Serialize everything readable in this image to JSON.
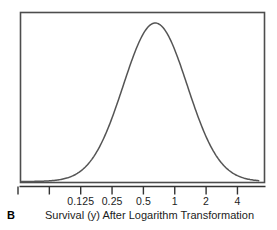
{
  "panel": {
    "letter": "B"
  },
  "axis": {
    "x_title": "Survival (y) After Logarithm Transformation"
  },
  "colors": {
    "curve": "#555555",
    "frame": "#4d4d4d",
    "axis": "#333333",
    "text": "#1c1c1c",
    "background": "#ffffff"
  },
  "chart_data": {
    "type": "line",
    "title": "",
    "subtitle": "",
    "xlabel": "Survival (y) After Logarithm Transformation",
    "ylabel": "",
    "x_scale": "log2",
    "grid": false,
    "legend": null,
    "annotations": [
      {
        "text": "B",
        "role": "panel-letter"
      }
    ],
    "tick_labels": [
      "",
      "",
      "0.125",
      "0.25",
      "0.5",
      "1",
      "2",
      "4"
    ],
    "ticks_visible_labels": [
      "0.125",
      "0.25",
      "0.5",
      "1",
      "2",
      "4"
    ],
    "tick_values": [
      0.03125,
      0.0625,
      0.125,
      0.25,
      0.5,
      1,
      2,
      4
    ],
    "xlim": [
      0.025,
      6.4
    ],
    "ylim": [
      0,
      1
    ],
    "distribution": {
      "shape": "normal-bell",
      "peak_x": 0.65,
      "peak_y": 1.0,
      "sigma_log2": 1.02
    },
    "series": [
      {
        "name": "Survival distribution (log scale)",
        "x": [
          0.0313,
          0.0394,
          0.0496,
          0.0625,
          0.0787,
          0.0992,
          0.125,
          0.1575,
          0.1984,
          0.25,
          0.315,
          0.3969,
          0.5,
          0.63,
          0.7937,
          1.0,
          1.2599,
          1.5874,
          2.0,
          2.5198,
          3.1748,
          4.0,
          5.0397,
          6.3496
        ],
        "y": [
          0.012,
          0.022,
          0.038,
          0.064,
          0.103,
          0.159,
          0.233,
          0.327,
          0.437,
          0.556,
          0.675,
          0.784,
          0.874,
          0.96,
          0.986,
          0.928,
          0.82,
          0.69,
          0.553,
          0.422,
          0.305,
          0.208,
          0.134,
          0.081
        ]
      }
    ]
  }
}
